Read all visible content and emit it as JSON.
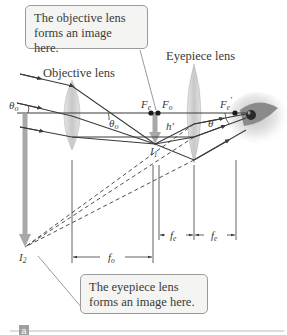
{
  "figure": {
    "panel_label": "a",
    "callouts": {
      "top": "The objective lens forms an image here.",
      "bottom": "The eyepiece lens forms an image here."
    },
    "lens_labels": {
      "objective": "Objective lens",
      "eyepiece": "Eyepiece lens"
    },
    "points": {
      "Fe": "F",
      "Fe_sub": "e",
      "Fo": "F",
      "Fo_sub": "o",
      "Fe_prime": "F",
      "Fe_prime_sub": "e",
      "I1": "I",
      "I1_sub": "1",
      "I2": "I",
      "I2_sub": "2",
      "h_prime": "h′"
    },
    "angles": {
      "theta_o": "θ",
      "theta_o_sub": "o",
      "theta": "θ"
    },
    "dimensions": {
      "fo": "f",
      "fo_sub": "o",
      "fe1": "f",
      "fe1_sub": "e",
      "fe2": "f",
      "fe2_sub": "e"
    },
    "colors": {
      "ray": "#3a3a3a",
      "lens": "#d6d6d6",
      "arrow": "#a8a8a8",
      "callout_bg": "#f4f4f2",
      "callout_border": "#9a9a9a",
      "panel_badge": "#a0a0a0"
    }
  }
}
